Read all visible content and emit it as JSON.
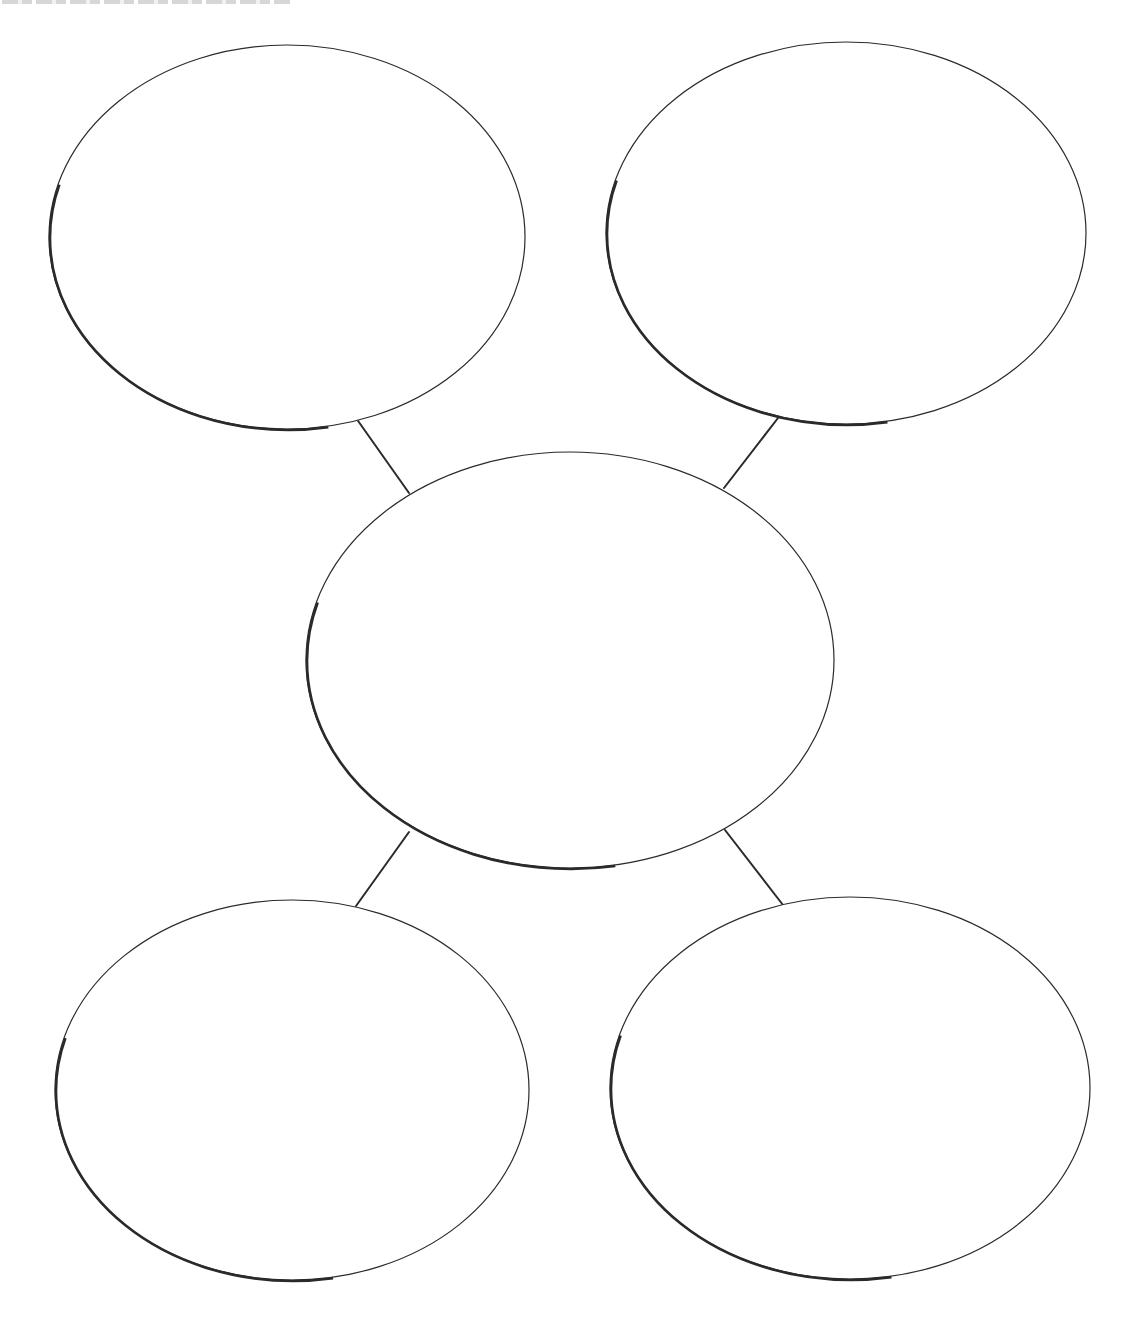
{
  "page": {
    "title_clipped": "",
    "title_note": "heading text is cut off at the top edge and not legible"
  },
  "diagram": {
    "type": "bubble-map",
    "stroke_color": "#2a2a2a",
    "background": "#ffffff",
    "nodes": [
      {
        "id": "top-left",
        "cx": 287,
        "cy": 237,
        "rx": 238,
        "ry": 192,
        "label": ""
      },
      {
        "id": "top-right",
        "cx": 846,
        "cy": 233,
        "rx": 240,
        "ry": 191,
        "label": ""
      },
      {
        "id": "center",
        "cx": 570,
        "cy": 660,
        "rx": 264,
        "ry": 208,
        "label": ""
      },
      {
        "id": "bottom-left",
        "cx": 292,
        "cy": 1090,
        "rx": 237,
        "ry": 190,
        "label": ""
      },
      {
        "id": "bottom-right",
        "cx": 850,
        "cy": 1088,
        "rx": 240,
        "ry": 191,
        "label": ""
      }
    ],
    "connectors": [
      {
        "from": "top-left",
        "to": "center",
        "x1": 356,
        "y1": 418,
        "x2": 409,
        "y2": 493
      },
      {
        "from": "top-right",
        "to": "center",
        "x1": 778,
        "y1": 418,
        "x2": 724,
        "y2": 488
      },
      {
        "from": "center",
        "to": "bottom-left",
        "x1": 409,
        "y1": 832,
        "x2": 356,
        "y2": 906
      },
      {
        "from": "center",
        "to": "bottom-right",
        "x1": 725,
        "y1": 830,
        "x2": 783,
        "y2": 905
      }
    ]
  }
}
